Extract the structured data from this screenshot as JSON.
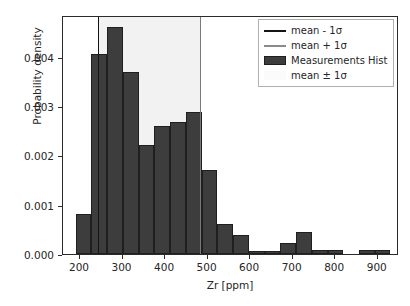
{
  "chart_data": {
    "type": "bar",
    "title": "",
    "xlabel": "Zr [ppm]",
    "ylabel": "Probability density",
    "xlim": [
      160,
      950
    ],
    "ylim": [
      0.0,
      0.00485
    ],
    "grid": false,
    "legend_position": "upper right",
    "xticks": [
      200,
      300,
      400,
      500,
      600,
      700,
      800,
      900
    ],
    "xtick_labels": [
      "200",
      "300",
      "400",
      "500",
      "600",
      "700",
      "800",
      "900"
    ],
    "yticks": [
      0.0,
      0.001,
      0.002,
      0.003,
      0.004
    ],
    "ytick_labels": [
      "0.000",
      "0.001",
      "0.002",
      "0.003",
      "0.004"
    ],
    "bin_edges": [
      190,
      227,
      264,
      301,
      338,
      375,
      412,
      449,
      486,
      523,
      560,
      597,
      634,
      671,
      708,
      745,
      782,
      819,
      856,
      893,
      930
    ],
    "values": [
      0.00081,
      0.00405,
      0.00461,
      0.0037,
      0.00222,
      0.00259,
      0.00267,
      0.00289,
      0.0017,
      0.0006,
      0.00038,
      7e-05,
      7e-05,
      0.00023,
      0.00045,
      8e-05,
      8e-05,
      0.0,
      8e-05,
      8e-05
    ],
    "series": [
      {
        "name": "Measurements Hist",
        "values": [
          0.00081,
          0.00405,
          0.00461,
          0.0037,
          0.00222,
          0.00259,
          0.00267,
          0.00289,
          0.0017,
          0.0006,
          0.00038,
          7e-05,
          7e-05,
          0.00023,
          0.00045,
          8e-05,
          8e-05,
          0.0,
          8e-05,
          8e-05
        ],
        "color": "#3d3d3d"
      }
    ],
    "annotations": {
      "mean_minus_1sigma": 243,
      "mean_plus_1sigma": 483,
      "band_label": "mean ± 1σ"
    }
  },
  "legend": {
    "entries": [
      {
        "label": "mean - 1σ",
        "marker": "line",
        "color": "#141414"
      },
      {
        "label": "mean + 1σ",
        "marker": "line",
        "color": "#8a8a8a"
      },
      {
        "label": "Measurements Hist",
        "marker": "patch",
        "color": "#3d3d3d"
      },
      {
        "label": "mean ± 1σ",
        "marker": "patch-light",
        "color": "#fbfbfb"
      }
    ]
  },
  "colors": {
    "bar_face": "#3d3d3d",
    "bar_edge": "#1f1f1f",
    "band": "#f2f2f2",
    "line_low": "#141414",
    "line_high": "#7a7a7a",
    "axis": "#2b2b2b",
    "background": "#ffffff"
  }
}
